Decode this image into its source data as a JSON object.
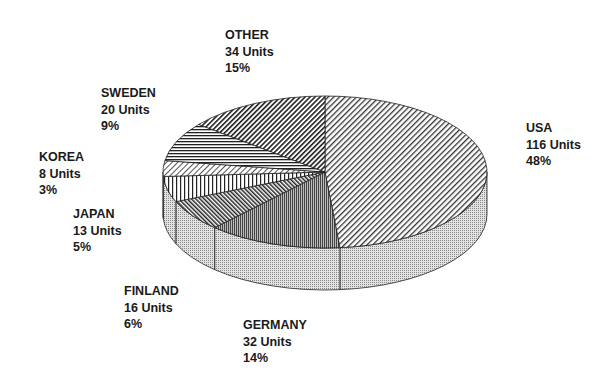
{
  "chart_data": {
    "type": "pie",
    "style": "3d-pie-hatched",
    "title": "",
    "unit": "Units",
    "categories": [
      "USA",
      "GERMANY",
      "FINLAND",
      "JAPAN",
      "KOREA",
      "SWEDEN",
      "OTHER"
    ],
    "values": [
      116,
      32,
      16,
      13,
      8,
      20,
      34
    ],
    "percent_labels": [
      "48%",
      "14%",
      "6%",
      "5%",
      "3%",
      "9%",
      "15%"
    ],
    "slices": [
      {
        "name": "USA",
        "units": 116,
        "units_label": "116 Units",
        "percent": "48%",
        "pattern": "diag-fine"
      },
      {
        "name": "GERMANY",
        "units": 32,
        "units_label": "32 Units",
        "percent": "14%",
        "pattern": "vertical-dense"
      },
      {
        "name": "FINLAND",
        "units": 16,
        "units_label": "16 Units",
        "percent": "6%",
        "pattern": "diag-back"
      },
      {
        "name": "JAPAN",
        "units": 13,
        "units_label": "13 Units",
        "percent": "5%",
        "pattern": "vertical"
      },
      {
        "name": "KOREA",
        "units": 8,
        "units_label": "8 Units",
        "percent": "3%",
        "pattern": "diag-light"
      },
      {
        "name": "SWEDEN",
        "units": 20,
        "units_label": "20 Units",
        "percent": "9%",
        "pattern": "horizontal"
      },
      {
        "name": "OTHER",
        "units": 34,
        "units_label": "34 Units",
        "percent": "15%",
        "pattern": "diag"
      }
    ],
    "legend": "none (direct labels)"
  },
  "labels": {
    "usa": {
      "name": "USA",
      "units": "116 Units",
      "pct": "48%"
    },
    "germany": {
      "name": "GERMANY",
      "units": "32 Units",
      "pct": "14%"
    },
    "finland": {
      "name": "FINLAND",
      "units": "16 Units",
      "pct": "6%"
    },
    "japan": {
      "name": "JAPAN",
      "units": "13 Units",
      "pct": "5%"
    },
    "korea": {
      "name": "KOREA",
      "units": "8 Units",
      "pct": "3%"
    },
    "sweden": {
      "name": "SWEDEN",
      "units": "20 Units",
      "pct": "9%"
    },
    "other": {
      "name": "OTHER",
      "units": "34 Units",
      "pct": "15%"
    }
  }
}
